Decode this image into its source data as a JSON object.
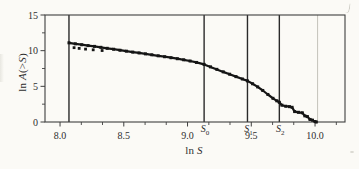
{
  "chart_data": {
    "type": "line",
    "xlabel": "ln S",
    "ylabel": "ln A(>S)",
    "xlabel_parts": {
      "prefix": "ln ",
      "variable": "S"
    },
    "ylabel_parts": {
      "prefix": "ln ",
      "var1": "A",
      "open_paren": "(>",
      "var2": "S",
      "close_paren": ")"
    },
    "xlim": [
      7.882,
      10.235
    ],
    "ylim": [
      0,
      15
    ],
    "x_ticks": [
      8.0,
      8.5,
      9.0,
      9.5,
      10.0
    ],
    "x_tick_labels": [
      "8.0",
      "8.5",
      "9.0",
      "9.5",
      "10.0"
    ],
    "x_minor_ticks": [
      8.167,
      8.333,
      8.667,
      8.833,
      9.167,
      9.333,
      9.667,
      9.833,
      10.167
    ],
    "y_ticks": [
      0,
      5,
      10,
      15
    ],
    "y_tick_labels": [
      "0",
      "5",
      "10",
      "15"
    ],
    "y_minor_ticks": [
      2.5,
      7.5,
      12.5
    ],
    "grid": "off",
    "legend": "none",
    "frame": "box",
    "vlines": [
      {
        "x": 8.07,
        "label": "",
        "subscript": "",
        "style": "dark",
        "name": "lower-cutoff-line"
      },
      {
        "x": 9.13,
        "label": "S",
        "subscript": "0",
        "style": "dark",
        "name": "threshold-line-S0"
      },
      {
        "x": 9.47,
        "label": "S",
        "subscript": "1",
        "style": "dark",
        "name": "threshold-line-S1"
      },
      {
        "x": 9.72,
        "label": "S",
        "subscript": "2",
        "style": "dark",
        "name": "threshold-line-S2"
      },
      {
        "x": 10.02,
        "label": "",
        "subscript": "",
        "style": "light",
        "name": "faint-line-at-10"
      }
    ],
    "series": [
      {
        "name": "cumulative-number-curve",
        "marker": "square",
        "points": [
          [
            8.07,
            11.1
          ],
          [
            8.12,
            10.96
          ],
          [
            8.17,
            10.83
          ],
          [
            8.22,
            10.71
          ],
          [
            8.27,
            10.6
          ],
          [
            8.32,
            10.47
          ],
          [
            8.37,
            10.33
          ],
          [
            8.42,
            10.2
          ],
          [
            8.47,
            10.06
          ],
          [
            8.52,
            9.93
          ],
          [
            8.57,
            9.8
          ],
          [
            8.62,
            9.68
          ],
          [
            8.67,
            9.55
          ],
          [
            8.72,
            9.42
          ],
          [
            8.77,
            9.28
          ],
          [
            8.82,
            9.15
          ],
          [
            8.87,
            9.01
          ],
          [
            8.92,
            8.87
          ],
          [
            8.97,
            8.72
          ],
          [
            9.02,
            8.55
          ],
          [
            9.07,
            8.35
          ],
          [
            9.13,
            8.08
          ],
          [
            9.18,
            7.73
          ],
          [
            9.23,
            7.38
          ],
          [
            9.28,
            7.03
          ],
          [
            9.33,
            6.7
          ],
          [
            9.38,
            6.36
          ],
          [
            9.43,
            6.03
          ],
          [
            9.47,
            5.76
          ],
          [
            9.51,
            5.36
          ],
          [
            9.55,
            4.92
          ],
          [
            9.59,
            4.42
          ],
          [
            9.63,
            3.86
          ],
          [
            9.67,
            3.32
          ],
          [
            9.7,
            2.97
          ],
          [
            9.72,
            2.76
          ],
          [
            9.74,
            2.36
          ],
          [
            9.77,
            2.21
          ],
          [
            9.8,
            2.15
          ],
          [
            9.82,
            2.06
          ],
          [
            9.84,
            1.46
          ],
          [
            9.87,
            1.36
          ],
          [
            9.9,
            1.29
          ],
          [
            9.92,
            0.86
          ],
          [
            9.94,
            0.76
          ],
          [
            9.96,
            0.36
          ],
          [
            9.98,
            0.26
          ],
          [
            10.0,
            0.06
          ],
          [
            10.01,
            0.0
          ]
        ]
      },
      {
        "name": "scatter-points-below-curve",
        "marker": "square",
        "points": [
          [
            8.11,
            10.42
          ],
          [
            8.15,
            10.32
          ],
          [
            8.2,
            10.22
          ],
          [
            8.26,
            10.12
          ],
          [
            8.33,
            10.02
          ]
        ]
      }
    ],
    "colors": {
      "curve": "#151515",
      "frame": "#3f3f3f",
      "vline_dark": "#2a2a2a",
      "vline_light": "#c4c3ba",
      "text": "#2e2e2e",
      "background": "#fbfaf6"
    }
  }
}
